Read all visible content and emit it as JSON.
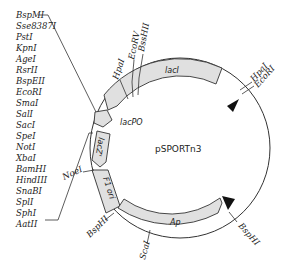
{
  "plasmid": {
    "name": "pSPORTn3"
  },
  "mcs_sites": [
    "BspMI",
    "Sse8387I",
    "PstI",
    "KpnI",
    "AgeI",
    "RsrII",
    "BspEII",
    "EcoRI",
    "SmaI",
    "SalI",
    "SacI",
    "SpeI",
    "NotI",
    "XbaI",
    "BamHI",
    "HindIII",
    "SnaBI",
    "SplI",
    "SphI",
    "AatII"
  ],
  "features": {
    "lacI": "lacI",
    "lacPO": "lacPO",
    "lacZ": "lacZ'",
    "f1ori": "F1 ori",
    "ap": "Ap"
  },
  "sites": {
    "hpaI_top": "HpaI",
    "ecoRV": "EcoRV",
    "bssHII": "BssHII",
    "hpaI_right": "HpaI",
    "ecoRI_right": "EcoRI",
    "noeI": "NoeI",
    "bspHI_left": "BspHI",
    "scaI": "ScaI",
    "bspHI_right": "BspHI"
  },
  "colors": {
    "feature_fill": "#e0e0e0",
    "stroke": "#333333",
    "arrow": "#111111"
  }
}
